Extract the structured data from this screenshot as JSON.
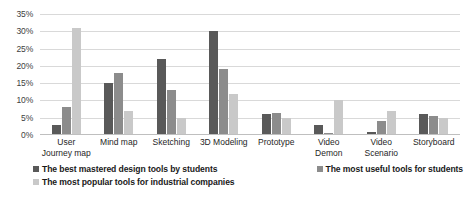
{
  "chart_data": {
    "type": "bar",
    "title": "",
    "xlabel": "",
    "ylabel": "",
    "ylim": [
      0,
      35
    ],
    "ytick_labels": [
      "0%",
      "5%",
      "10%",
      "15%",
      "20%",
      "25%",
      "30%",
      "35%"
    ],
    "ytick_values": [
      0,
      5,
      10,
      15,
      20,
      25,
      30,
      35
    ],
    "grid": true,
    "legend_position": "bottom",
    "categories": [
      "User Journey map",
      "Mind map",
      "Sketching",
      "3D Modeling",
      "Prototype",
      "Video Demon",
      "Video Scenario",
      "Storyboard"
    ],
    "series": [
      {
        "name": "The best mastered design tools by students",
        "color": "#595959",
        "values": [
          3,
          15,
          22,
          30,
          6,
          3,
          1,
          6
        ]
      },
      {
        "name": "The most useful tools for students",
        "color": "#8c8c8c",
        "values": [
          8,
          18,
          13,
          19,
          6.5,
          0.5,
          4,
          5.5
        ]
      },
      {
        "name": "The most popular tools for industrial companies",
        "color": "#c9c9c9",
        "values": [
          31,
          7,
          5,
          12,
          5,
          10,
          7,
          5
        ]
      }
    ]
  }
}
